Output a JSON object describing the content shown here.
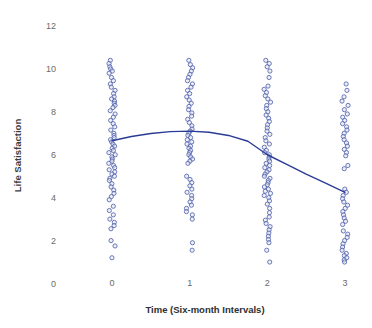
{
  "chart_data": {
    "type": "scatter",
    "title": "",
    "xlabel": "Time (Six-month Intervals)",
    "ylabel": "Life Satisfaction",
    "xlim": [
      -0.35,
      3.45
    ],
    "ylim": [
      0,
      12
    ],
    "xticks": [
      0,
      1,
      2,
      3
    ],
    "xtick_labels": [
      "0",
      "1",
      "2",
      "3"
    ],
    "yticks": [
      0,
      2,
      4,
      6,
      8,
      10,
      12
    ],
    "ytick_labels": [
      "0",
      "2",
      "4",
      "6",
      "8",
      "10",
      "12"
    ],
    "grid": false,
    "legend": "none",
    "marker": {
      "shape": "circle-open",
      "edge_color": "#4a5ba8",
      "face_color": "#dfe3f0",
      "size": 4.2
    },
    "trend_line": {
      "name": "Quadratic trend",
      "color": "#2a3b96",
      "width": 1.4,
      "x": [
        0,
        0.25,
        0.5,
        0.75,
        1,
        1.25,
        1.5,
        1.75,
        2,
        2.25,
        2.5,
        2.75,
        3
      ],
      "y": [
        6.65,
        6.85,
        6.99,
        7.08,
        7.1,
        7.05,
        6.9,
        6.63,
        6.0,
        5.55,
        5.1,
        4.68,
        4.25
      ]
    },
    "series": [
      {
        "name": "Life satisfaction at time 0",
        "x_value": 0,
        "values": [
          10.4,
          10.25,
          10.1,
          10.0,
          9.9,
          9.8,
          9.6,
          9.45,
          9.3,
          9.15,
          9.0,
          8.85,
          8.7,
          8.6,
          8.5,
          8.4,
          8.3,
          8.2,
          8.05,
          7.9,
          7.75,
          7.6,
          7.45,
          7.3,
          7.15,
          7.0,
          6.9,
          6.8,
          6.7,
          6.6,
          6.5,
          6.4,
          6.3,
          6.2,
          6.1,
          6.0,
          5.9,
          5.8,
          5.7,
          5.6,
          5.5,
          5.4,
          5.3,
          5.2,
          5.1,
          5.0,
          4.9,
          4.8,
          4.65,
          4.5,
          4.35,
          4.2,
          4.05,
          3.9,
          3.6,
          3.4,
          3.2,
          3.0,
          2.85,
          2.7,
          2.55,
          2.0,
          1.75,
          1.2
        ]
      },
      {
        "name": "Life satisfaction at time 1",
        "x_value": 1,
        "values": [
          10.4,
          10.2,
          10.05,
          9.9,
          9.75,
          9.6,
          9.45,
          9.3,
          9.15,
          9.0,
          8.85,
          8.7,
          8.55,
          8.4,
          8.25,
          8.1,
          7.95,
          7.8,
          7.65,
          7.5,
          7.35,
          7.2,
          7.1,
          7.0,
          6.9,
          6.8,
          6.7,
          6.6,
          6.5,
          6.4,
          6.3,
          6.2,
          6.1,
          6.0,
          5.9,
          5.8,
          5.7,
          5.6,
          5.0,
          4.85,
          4.7,
          4.55,
          4.4,
          4.25,
          4.1,
          3.95,
          3.8,
          3.65,
          3.5,
          3.35,
          3.2,
          3.0,
          1.9,
          1.55
        ]
      },
      {
        "name": "Life satisfaction at time 2",
        "x_value": 2,
        "values": [
          10.4,
          10.25,
          10.1,
          9.9,
          9.6,
          9.2,
          9.05,
          8.9,
          8.75,
          8.6,
          8.45,
          8.3,
          8.15,
          8.0,
          7.85,
          7.7,
          7.55,
          7.4,
          7.25,
          7.1,
          6.95,
          6.8,
          6.65,
          6.5,
          6.35,
          6.2,
          6.1,
          6.0,
          5.9,
          5.8,
          5.7,
          5.6,
          5.5,
          5.4,
          5.3,
          5.2,
          5.1,
          5.0,
          4.9,
          4.8,
          4.7,
          4.6,
          4.5,
          4.4,
          4.3,
          4.2,
          4.1,
          4.0,
          3.85,
          3.7,
          3.5,
          3.3,
          3.1,
          2.95,
          2.8,
          2.65,
          2.5,
          2.35,
          2.2,
          2.05,
          1.9,
          1.55,
          1.0
        ]
      },
      {
        "name": "Life satisfaction at time 3",
        "x_value": 3,
        "values": [
          9.3,
          9.0,
          8.7,
          8.5,
          8.3,
          8.1,
          7.9,
          7.75,
          7.6,
          7.45,
          7.3,
          7.15,
          7.0,
          6.85,
          6.7,
          6.55,
          6.4,
          6.25,
          6.1,
          5.95,
          5.5,
          5.35,
          4.4,
          4.25,
          4.1,
          3.95,
          3.8,
          3.65,
          3.5,
          3.35,
          3.2,
          3.05,
          2.9,
          2.75,
          2.45,
          2.3,
          2.15,
          2.0,
          1.85,
          1.7,
          1.55,
          1.4,
          1.3,
          1.2,
          1.1,
          1.0
        ]
      }
    ]
  },
  "axes": {
    "ylabel_text": "Life Satisfaction",
    "xlabel_text": "Time (Six-month Intervals)"
  }
}
